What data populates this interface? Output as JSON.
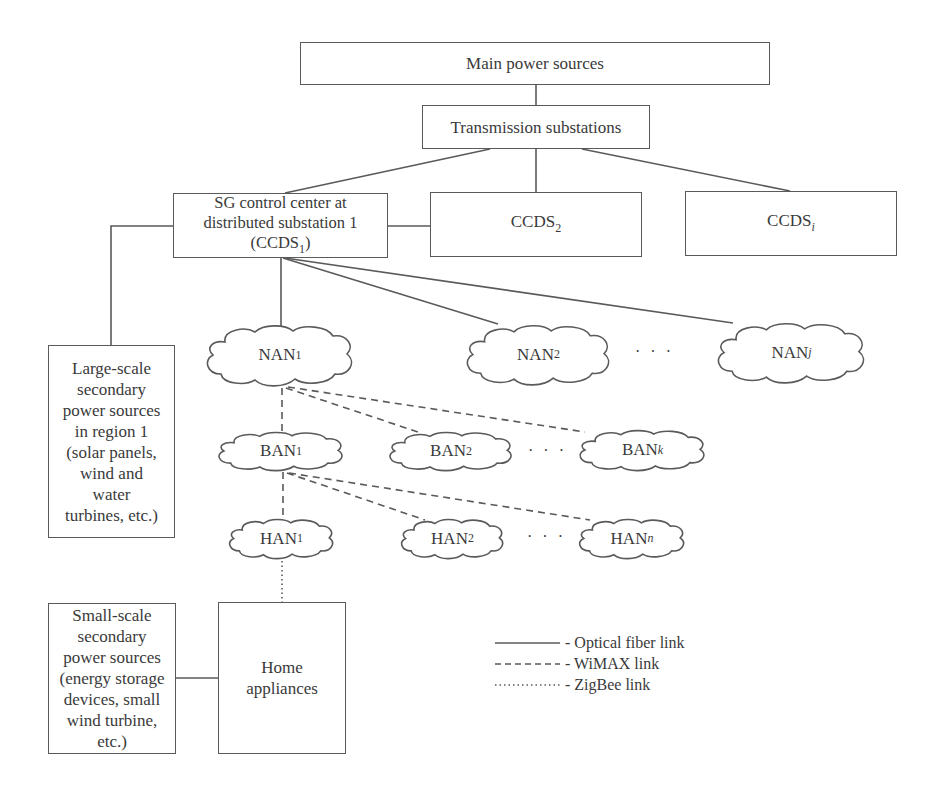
{
  "diagram": {
    "boxes": {
      "main_power": {
        "label": "Main power sources"
      },
      "transmission": {
        "label": "Transmission substations"
      },
      "ccds1": {
        "label": "SG control center at\ndistributed substation 1\n(CCDS",
        "sub": "1",
        "suffix": ")"
      },
      "ccds2": {
        "label": "CCDS",
        "sub": "2"
      },
      "ccdsi": {
        "label": "CCDS",
        "sub": "i"
      },
      "large_scale": {
        "label": "Large-scale\nsecondary\npower sources\nin region 1\n(solar panels,\nwind and\nwater\nturbines, etc.)"
      },
      "small_scale": {
        "label": "Small-scale\nsecondary\npower sources\n(energy storage\ndevices, small\nwind turbine,\netc.)"
      },
      "home_appliances": {
        "label": "Home\nappliances"
      }
    },
    "clouds": {
      "nan1": {
        "label": "NAN",
        "sub": "1"
      },
      "nan2": {
        "label": "NAN",
        "sub": "2"
      },
      "nanj": {
        "label": "NAN",
        "sub": "j"
      },
      "ban1": {
        "label": "BAN",
        "sub": "1"
      },
      "ban2": {
        "label": "BAN",
        "sub": "2"
      },
      "bank": {
        "label": "BAN",
        "sub": "k"
      },
      "han1": {
        "label": "HAN",
        "sub": "1"
      },
      "han2": {
        "label": "HAN",
        "sub": "2"
      },
      "hann": {
        "label": "HAN",
        "sub": "n"
      }
    },
    "ellipsis": "· · ·",
    "legend": [
      {
        "style": "solid",
        "label": "- Optical fiber link"
      },
      {
        "style": "dashed",
        "label": "- WiMAX link"
      },
      {
        "style": "dotted",
        "label": "- ZigBee link"
      }
    ],
    "colors": {
      "line": "#5a5a5a",
      "text": "#3a3a3a",
      "background": "#ffffff"
    }
  }
}
